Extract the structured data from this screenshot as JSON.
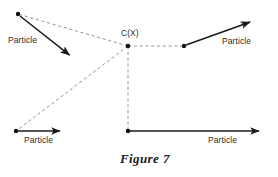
{
  "figure": {
    "caption": "Figure 7",
    "background_color": "#ffffff",
    "stroke_color": "#1a1a1a",
    "dashed_color": "#8a8a8a",
    "text_color": "#2b2b2b",
    "width": 278,
    "height": 177
  },
  "center_node": {
    "label": "C(X)",
    "x": 128,
    "y": 46,
    "label_x": 121,
    "label_y": 30
  },
  "particles": [
    {
      "id": "particle-top-left",
      "label": "Particle",
      "label_x": 8,
      "label_y": 37,
      "dot": {
        "x": 18,
        "y": 14
      },
      "arrow": {
        "x1": 20,
        "y1": 16,
        "x2": 72,
        "y2": 57
      },
      "direction": "down-right",
      "dashed_to_center": true
    },
    {
      "id": "particle-bottom-left",
      "label": "Particle",
      "label_x": 24,
      "label_y": 137,
      "dot": {
        "x": 16,
        "y": 131
      },
      "arrow": {
        "x1": 17,
        "y1": 131,
        "x2": 63,
        "y2": 131
      },
      "direction": "right",
      "dashed_to_center": true
    },
    {
      "id": "particle-right-upper",
      "label": "Particle",
      "label_x": 222,
      "label_y": 38,
      "dot": {
        "x": 184,
        "y": 46
      },
      "arrow": {
        "x1": 186,
        "y1": 45,
        "x2": 253,
        "y2": 21
      },
      "direction": "up-right",
      "dashed_to_center": true
    },
    {
      "id": "particle-bottom-center",
      "label": "Particle",
      "label_x": 208,
      "label_y": 137,
      "dot": {
        "x": 128,
        "y": 131
      },
      "arrow": {
        "x1": 129,
        "y1": 131,
        "x2": 262,
        "y2": 131
      },
      "direction": "right",
      "dashed_to_center": true
    }
  ],
  "dashed_edges": [
    {
      "id": "edge-center-to-top-left",
      "x1": 128,
      "y1": 46,
      "x2": 18,
      "y2": 14
    },
    {
      "id": "edge-center-to-bottom-left",
      "x1": 128,
      "y1": 46,
      "x2": 16,
      "y2": 131
    },
    {
      "id": "edge-center-to-bottom-center",
      "x1": 128,
      "y1": 46,
      "x2": 128,
      "y2": 131
    },
    {
      "id": "edge-center-to-right",
      "x1": 128,
      "y1": 46,
      "x2": 184,
      "y2": 46
    }
  ],
  "caption_position": {
    "x": 120,
    "y": 153
  }
}
